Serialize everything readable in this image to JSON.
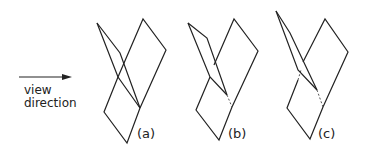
{
  "arrow": {
    "label_line1": "view",
    "label_line2": "direction"
  },
  "panels": [
    {
      "id": "a",
      "label": "(a)"
    },
    {
      "id": "b",
      "label": "(b)"
    },
    {
      "id": "c",
      "label": "(c)"
    }
  ],
  "colors": {
    "stroke": "#222222",
    "background": "#ffffff"
  }
}
